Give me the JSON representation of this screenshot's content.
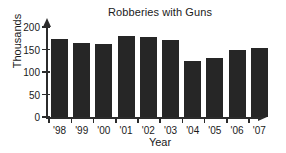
{
  "chart_data": {
    "type": "bar",
    "title": "Robberies with Guns",
    "xlabel": "Year",
    "ylabel": "Thousands",
    "categories": [
      "'98",
      "'99",
      "'00",
      "'01",
      "'02",
      "'03",
      "'04",
      "'05",
      "'06",
      "'07"
    ],
    "values": [
      174,
      164,
      162,
      180,
      178,
      171,
      125,
      132,
      150,
      154
    ],
    "ylim": [
      0,
      200
    ],
    "yticks": [
      0,
      50,
      100,
      150,
      200
    ],
    "ytick_labels": [
      "0",
      "50",
      "100",
      "150",
      "200"
    ],
    "grid": false,
    "legend": null,
    "bar_color": "#262626",
    "axis_color": "#2b2b2b",
    "text_color": "#1a1a1a",
    "background": "#ffffff"
  }
}
